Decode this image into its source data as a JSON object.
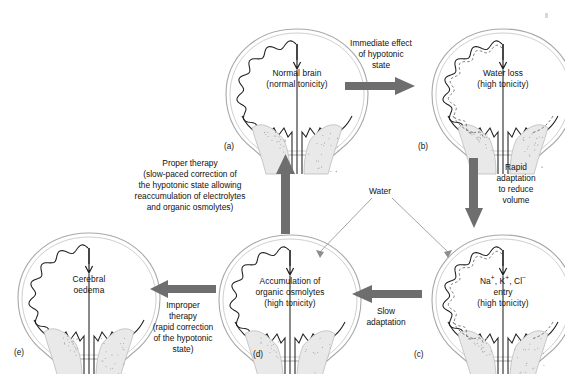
{
  "figure": {
    "background": "#ffffff",
    "arrow_color": "#6e6e6e",
    "line_color": "#9a9a9a",
    "ink_color": "#111111"
  },
  "panels": [
    {
      "id": "a",
      "label": "(a)",
      "lines": [
        "Normal brain",
        "(normal tonicity)"
      ],
      "dashed_inner": false,
      "x": 222,
      "y": 24
    },
    {
      "id": "b",
      "label": "(b)",
      "lines": [
        "Water loss",
        "(high tonicity)"
      ],
      "dashed_inner": true,
      "x": 428,
      "y": 24
    },
    {
      "id": "c",
      "label": "(c)",
      "lines": [
        "Na+, K+, Cl- entry",
        "(high tonicity)"
      ],
      "line1_html": "Na<sup>+</sup>, K<sup>+</sup>, Cl<sup>&minus;</sup>",
      "line2_html": "entry",
      "line3_html": "(high tonicity)",
      "dashed_inner": true,
      "x": 428,
      "y": 230
    },
    {
      "id": "d",
      "label": "(d)",
      "lines": [
        "Accumulation of",
        "organic osmolytes",
        "(high tonicity)"
      ],
      "dashed_inner": false,
      "x": 215,
      "y": 230
    },
    {
      "id": "e",
      "label": "(e)",
      "lines": [
        "Cerebral",
        "oedema"
      ],
      "dashed_inner": false,
      "x": 14,
      "y": 228
    }
  ],
  "annotations": {
    "immediate_effect": [
      "Immediate effect",
      "of hypotonic",
      "state"
    ],
    "rapid_adaptation": [
      "Rapid",
      "adaptation",
      "to reduce",
      "volume"
    ],
    "slow_adaptation": [
      "Slow",
      "adaptation"
    ],
    "improper_therapy": [
      "Improper",
      "therapy",
      "(rapid correction",
      "of the hypotonic",
      "state)"
    ],
    "proper_therapy": [
      "Proper therapy",
      "(slow-paced correction of",
      "the hypotonic state allowing",
      "reaccumulation of electrolytes",
      "and organic osmolytes)"
    ],
    "water": "Water"
  },
  "arrows": [
    {
      "name": "arrow-a-to-b",
      "direction": "right"
    },
    {
      "name": "arrow-b-to-c",
      "direction": "down"
    },
    {
      "name": "arrow-c-to-d",
      "direction": "left"
    },
    {
      "name": "arrow-d-to-e",
      "direction": "left"
    },
    {
      "name": "arrow-d-to-a",
      "direction": "up"
    },
    {
      "name": "water-leader-to-d",
      "direction": "down-left"
    },
    {
      "name": "water-leader-to-c",
      "direction": "down-right"
    }
  ]
}
